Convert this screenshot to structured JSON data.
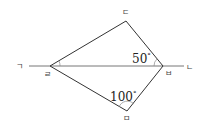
{
  "diagram": {
    "type": "geometry",
    "line": {
      "left_label": "ㄱ",
      "right_label": "ㄴ"
    },
    "points": {
      "r": {
        "label": "ㄹ",
        "x": 50,
        "y": 66
      },
      "d": {
        "label": "ㄷ",
        "x": 126,
        "y": 21
      },
      "b": {
        "label": "ㅂ",
        "x": 163,
        "y": 66
      },
      "m": {
        "label": "ㅁ",
        "x": 127,
        "y": 111
      }
    },
    "angles": [
      {
        "vertex": "ㅂ",
        "between": [
          "ㄹ",
          "ㄷ"
        ],
        "value": "50",
        "unit": "°"
      },
      {
        "vertex": "ㅁ",
        "between": [
          "ㄹ",
          "ㅂ"
        ],
        "value": "100",
        "unit": "°"
      }
    ],
    "colors": {
      "stroke": "#333333",
      "text": "#222222",
      "background": "#ffffff"
    }
  }
}
